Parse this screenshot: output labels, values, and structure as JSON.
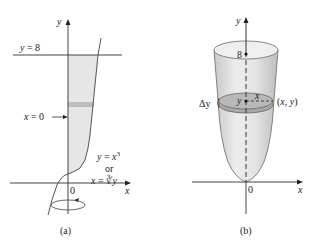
{
  "panel_a": {
    "caption": "(a)",
    "y_axis_label": "y",
    "x_axis_label": "x",
    "origin_label": "0",
    "line_label": "y = 8",
    "x0_label": "x = 0",
    "curve_label_1": "y = x",
    "curve_label_1_exp": "3",
    "curve_label_or": "or",
    "curve_label_2": "x = ∛y",
    "rotation_icon": "rotation-arrow-icon"
  },
  "panel_b": {
    "caption": "(b)",
    "y_axis_label": "y",
    "x_axis_label": "x",
    "origin_label": "0",
    "top_label": "8",
    "dy_label": "Δy",
    "point_y_label": "y",
    "radius_label": "x",
    "point_label": "(x, y)"
  }
}
